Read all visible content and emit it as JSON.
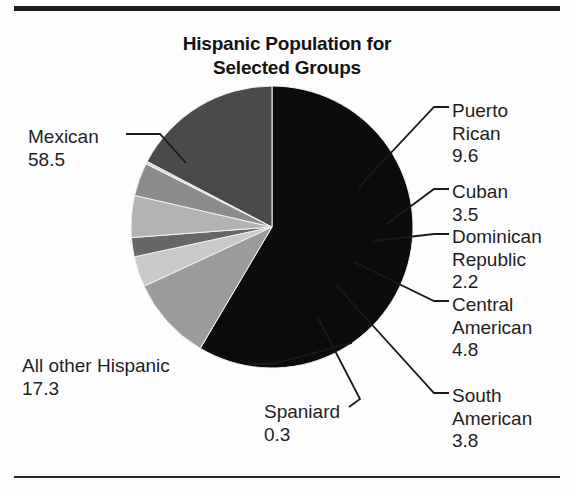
{
  "chart_data": {
    "type": "pie",
    "title": "Hispanic Population for Selected Groups",
    "title_line1": "Hispanic Population for",
    "title_line2": "Selected Groups",
    "xlabel": "",
    "ylabel": "",
    "legend": "none",
    "grid": false,
    "categories": [
      "Mexican",
      "Puerto Rican",
      "Cuban",
      "Dominican Republic",
      "Central American",
      "South American",
      "Spaniard",
      "All other Hispanic"
    ],
    "values": [
      58.5,
      9.6,
      3.5,
      2.2,
      4.8,
      3.8,
      0.3,
      17.3
    ],
    "value_labels": [
      "58.5",
      "9.6",
      "3.5",
      "2.2",
      "4.8",
      "3.8",
      "0.3",
      "17.3"
    ],
    "colors": [
      "#0c0c0c",
      "#9b9b9b",
      "#c9c9c9",
      "#676767",
      "#b3b3b3",
      "#8b8b8b",
      "#d8d8d8",
      "#4a4a4a"
    ],
    "slices": [
      {
        "name": "Mexican",
        "label_line1": "Mexican",
        "label_line2": "",
        "value": 58.5,
        "value_label": "58.5",
        "color": "#0c0c0c"
      },
      {
        "name": "Puerto Rican",
        "label_line1": "Puerto",
        "label_line2": "Rican",
        "value": 9.6,
        "value_label": "9.6",
        "color": "#9b9b9b"
      },
      {
        "name": "Cuban",
        "label_line1": "Cuban",
        "label_line2": "",
        "value": 3.5,
        "value_label": "3.5",
        "color": "#c9c9c9"
      },
      {
        "name": "Dominican Republic",
        "label_line1": "Dominican",
        "label_line2": "Republic",
        "value": 2.2,
        "value_label": "2.2",
        "color": "#676767"
      },
      {
        "name": "Central American",
        "label_line1": "Central",
        "label_line2": "American",
        "value": 4.8,
        "value_label": "4.8",
        "color": "#b3b3b3"
      },
      {
        "name": "South American",
        "label_line1": "South",
        "label_line2": "American",
        "value": 3.8,
        "value_label": "3.8",
        "color": "#8b8b8b"
      },
      {
        "name": "Spaniard",
        "label_line1": "Spaniard",
        "label_line2": "",
        "value": 0.3,
        "value_label": "0.3",
        "color": "#d8d8d8"
      },
      {
        "name": "All other Hispanic",
        "label_line1": "All other Hispanic",
        "label_line2": "",
        "value": 17.3,
        "value_label": "17.3",
        "color": "#4a4a4a"
      }
    ]
  }
}
